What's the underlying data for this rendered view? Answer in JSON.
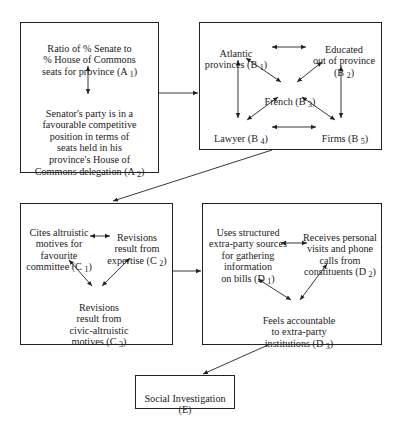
{
  "diagram": {
    "boxes": [
      {
        "id": "A",
        "nodes": [
          {
            "id": "A1",
            "text": "Ratio of % Senate to\n% House of Commons\nseats for province (A 1)"
          },
          {
            "id": "A2",
            "text": "Senator's party is in a\nfavourable competitive\nposition in terms of\nseats held in his\nprovince's House of\nCommons delegation (A 2)"
          }
        ]
      },
      {
        "id": "B",
        "nodes": [
          {
            "id": "B1",
            "text": "Atlantic\nprovinces (B 1)"
          },
          {
            "id": "B2",
            "text": "Educated\nout of province\n(B 2)"
          },
          {
            "id": "B3",
            "text": "French (B 3)"
          },
          {
            "id": "B4",
            "text": "Lawyer (B 4)"
          },
          {
            "id": "B5",
            "text": "Firms (B 5)"
          }
        ]
      },
      {
        "id": "C",
        "nodes": [
          {
            "id": "C1",
            "text": "Cites altruistic\nmotives for\nfavourite\ncommittee (C 1)"
          },
          {
            "id": "C2",
            "text": "Revisions\nresult from\nexpertise (C 2)"
          },
          {
            "id": "C3",
            "text": "Revisions\nresult from\ncivic-altruistic\nmotives (C 3)"
          }
        ]
      },
      {
        "id": "D",
        "nodes": [
          {
            "id": "D1",
            "text": "Uses structured\nextra-party sources\nfor gathering\ninformation\non bills (D 1)"
          },
          {
            "id": "D2",
            "text": "Receives personal\nvisits and phone\ncalls from\nconstituents (D 2)"
          },
          {
            "id": "D3",
            "text": "Feels accountable\nto extra-party\ninstitutions (D 3)"
          }
        ]
      },
      {
        "id": "E",
        "nodes": [
          {
            "id": "E",
            "text": "Social Investigation\n(E)"
          }
        ]
      }
    ],
    "edges": [
      {
        "from": "A1",
        "to": "A2",
        "type": "bidirectional"
      },
      {
        "from": "B1",
        "to": "B2",
        "type": "bidirectional"
      },
      {
        "from": "B1",
        "to": "B3",
        "type": "bidirectional"
      },
      {
        "from": "B2",
        "to": "B3",
        "type": "bidirectional"
      },
      {
        "from": "B1",
        "to": "B4",
        "type": "bidirectional"
      },
      {
        "from": "B2",
        "to": "B5",
        "type": "bidirectional"
      },
      {
        "from": "B3",
        "to": "B4",
        "type": "bidirectional"
      },
      {
        "from": "B3",
        "to": "B5",
        "type": "bidirectional"
      },
      {
        "from": "B4",
        "to": "B5",
        "type": "bidirectional"
      },
      {
        "from": "C1",
        "to": "C2",
        "type": "bidirectional"
      },
      {
        "from": "C1",
        "to": "C3",
        "type": "bidirectional"
      },
      {
        "from": "C2",
        "to": "C3",
        "type": "bidirectional"
      },
      {
        "from": "D1",
        "to": "D2",
        "type": "bidirectional"
      },
      {
        "from": "D1",
        "to": "D3",
        "type": "bidirectional"
      },
      {
        "from": "D2",
        "to": "D3",
        "type": "bidirectional"
      },
      {
        "from": "A",
        "to": "B",
        "type": "directed"
      },
      {
        "from": "B",
        "to": "C",
        "type": "directed"
      },
      {
        "from": "C",
        "to": "D",
        "type": "directed"
      },
      {
        "from": "D",
        "to": "E",
        "type": "directed"
      }
    ]
  },
  "labels": {
    "A1a": "Ratio of % Senate to\n% House of Commons\nseats for province (A ",
    "A1s": "1",
    "A1b": ")",
    "A2a": "Senator's party is in a\nfavourable competitive\nposition in terms of\nseats held in his\nprovince's House of\nCommons delegation (A ",
    "A2s": "2",
    "A2b": ")",
    "B1a": "Atlantic\nprovinces (B ",
    "B1s": "1",
    "B1b": ")",
    "B2a": "Educated\nout of province\n(B ",
    "B2s": "2",
    "B2b": ")",
    "B3a": "French (B ",
    "B3s": "3",
    "B3b": ")",
    "B4a": "Lawyer (B ",
    "B4s": "4",
    "B4b": ")",
    "B5a": "Firms (B ",
    "B5s": "5",
    "B5b": ")",
    "C1a": "Cites altruistic\nmotives for\nfavourite\ncommittee (C ",
    "C1s": "1",
    "C1b": ")",
    "C2a": "Revisions\nresult from\nexpertise (C ",
    "C2s": "2",
    "C2b": ")",
    "C3a": "Revisions\nresult from\ncivic-altruistic\nmotives (C ",
    "C3s": "3",
    "C3b": ")",
    "D1a": "Uses structured\nextra-party sources\nfor gathering\ninformation\non bills (D ",
    "D1s": "1",
    "D1b": ")",
    "D2a": "Receives personal\nvisits and phone\ncalls from\nconstituents (D ",
    "D2s": "2",
    "D2b": ")",
    "D3a": "Feels accountable\nto extra-party\ninstitutions (D ",
    "D3s": "3",
    "D3b": ")",
    "Ea": "Social Investigation\n(E)"
  }
}
